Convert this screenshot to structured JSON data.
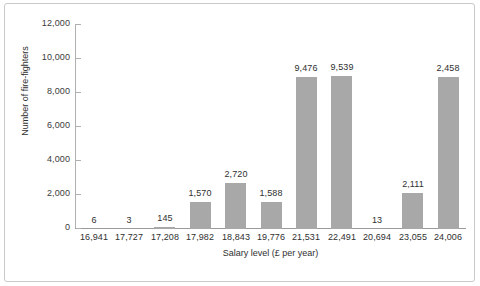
{
  "chart_data": {
    "type": "bar",
    "title": "",
    "xlabel": "Salary level (£ per year)",
    "ylabel": "Number of fire-fighters",
    "categories": [
      "16,941",
      "17,727",
      "17,208",
      "17,982",
      "18,843",
      "19,776",
      "21,531",
      "22,491",
      "20,694",
      "23,055",
      "24,006"
    ],
    "values": [
      6,
      3,
      145,
      1570,
      2720,
      1588,
      9476,
      9539,
      13,
      2111,
      2458
    ],
    "data_labels": [
      "6",
      "3",
      "145",
      "1,570",
      "2,720",
      "1,588",
      "9,476",
      "9,539",
      "13",
      "2,111",
      "2,458"
    ],
    "bar_pixel_values": [
      0,
      0,
      145,
      1570,
      2720,
      1588,
      8950,
      9000,
      0,
      2111,
      8950
    ],
    "ylim": [
      0,
      12000
    ],
    "ytick_values": [
      0,
      2000,
      4000,
      6000,
      8000,
      10000,
      12000
    ],
    "ytick_labels": [
      "0",
      "2,000",
      "4,000",
      "6,000",
      "8,000",
      "10,000",
      "12,000"
    ],
    "grid": false,
    "legend": false,
    "bar_color": "#a8a8a8",
    "axis_color": "#9a9a9a",
    "text_color": "#2f2f2f",
    "frame_color": "#c9c9c9"
  }
}
